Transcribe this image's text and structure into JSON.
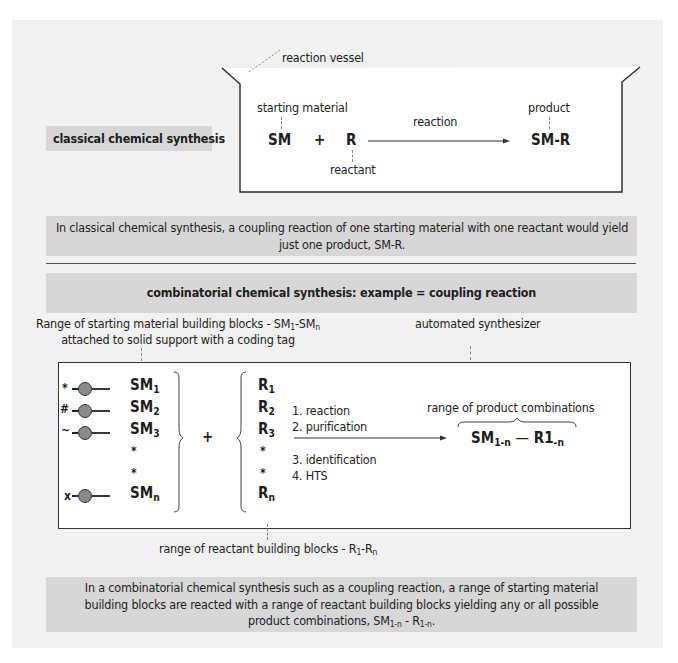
{
  "classical": {
    "label": "classical chemical synthesis",
    "vessel_label": "reaction vessel",
    "starting_material_label": "starting material",
    "reactant_label": "reactant",
    "product_label": "product",
    "sm": "SM",
    "plus": "+",
    "r": "R",
    "arrow_label": "reaction",
    "product": "SM-R",
    "summary": "In classical chemical synthesis, a coupling reaction of one starting material with one reactant would yield just one product, SM-R."
  },
  "combinatorial": {
    "header": "combinatorial chemical synthesis: example = coupling reaction",
    "sm_range_label_line1_prefix": "Range of starting material building blocks - SM",
    "sm_range_sub1": "1",
    "sm_range_mid": "-SM",
    "sm_range_subn": "n",
    "sm_range_label_line2": "attached to solid support with a coding tag",
    "synthesizer_label": "automated synthesizer",
    "starting_materials": [
      {
        "tag": "*",
        "base": "SM",
        "sub": "1"
      },
      {
        "tag": "#",
        "base": "SM",
        "sub": "2"
      },
      {
        "tag": "~",
        "base": "SM",
        "sub": "3"
      },
      {
        "tag": "",
        "base": "*",
        "sub": ""
      },
      {
        "tag": "",
        "base": "*",
        "sub": ""
      },
      {
        "tag": "x",
        "base": "SM",
        "sub": "n"
      }
    ],
    "plus": "+",
    "reactants": [
      {
        "base": "R",
        "sub": "1"
      },
      {
        "base": "R",
        "sub": "2"
      },
      {
        "base": "R",
        "sub": "3"
      },
      {
        "base": "*",
        "sub": ""
      },
      {
        "base": "*",
        "sub": ""
      },
      {
        "base": "R",
        "sub": "n"
      }
    ],
    "steps_above": [
      "1. reaction",
      "2. purification"
    ],
    "steps_below": [
      "3. identification",
      "4. HTS"
    ],
    "product_range_label": "range of product combinations",
    "product_sm": "SM",
    "product_sm_sub": "1-n",
    "product_dash": "—",
    "product_r": "R1",
    "product_r_sub": "-n",
    "reactant_range_prefix": "range of reactant building blocks - R",
    "reactant_range_sub1": "1",
    "reactant_range_mid": "-R",
    "reactant_range_subn": "n",
    "summary_line1": "In a combinatorial chemical synthesis such as a coupling reaction, a range of starting material",
    "summary_line2": "building blocks are reacted with a range of reactant building blocks yielding any or all possible",
    "summary_line3_prefix": "product combinations, SM",
    "summary_sub1": "1-n",
    "summary_mid": " - R",
    "summary_sub2": "1-n",
    "summary_end": "."
  },
  "colors": {
    "panel": "#f1f1f1",
    "box": "#d7d7d7",
    "bead": "#8a8a8a",
    "line": "#333333"
  }
}
